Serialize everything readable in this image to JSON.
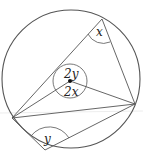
{
  "diagram": {
    "type": "circle-theorem",
    "circle": {
      "cx": 71,
      "cy": 79,
      "r": 69
    },
    "center": {
      "x": 70,
      "y": 81
    },
    "points": {
      "A": {
        "x": 102,
        "y": 19
      },
      "B": {
        "x": 135,
        "y": 104
      },
      "C": {
        "x": 12,
        "y": 118
      },
      "D": {
        "x": 45,
        "y": 150
      }
    },
    "angles": {
      "angle_at_top": "x",
      "angle_at_bottom": "y",
      "center_upper": "2y",
      "center_lower": "2x"
    },
    "colors": {
      "stroke": "#555555",
      "text": "#222222"
    }
  }
}
